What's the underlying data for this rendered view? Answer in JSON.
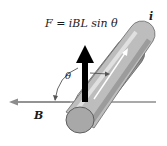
{
  "figure": {
    "formula": "F = iBL sin θ",
    "current_label": "i",
    "field_label": "B",
    "angle_label": "θ"
  },
  "colors": {
    "background": "#ffffff",
    "conductor_light": "#d9d9d9",
    "conductor_dark": "#7a7a7a",
    "end_cap": "#a8a8a8",
    "force_arrow": "#000000",
    "field_line": "#8c8c8c",
    "current_arrow": "#ffffff",
    "text": "#1a1a1a"
  }
}
